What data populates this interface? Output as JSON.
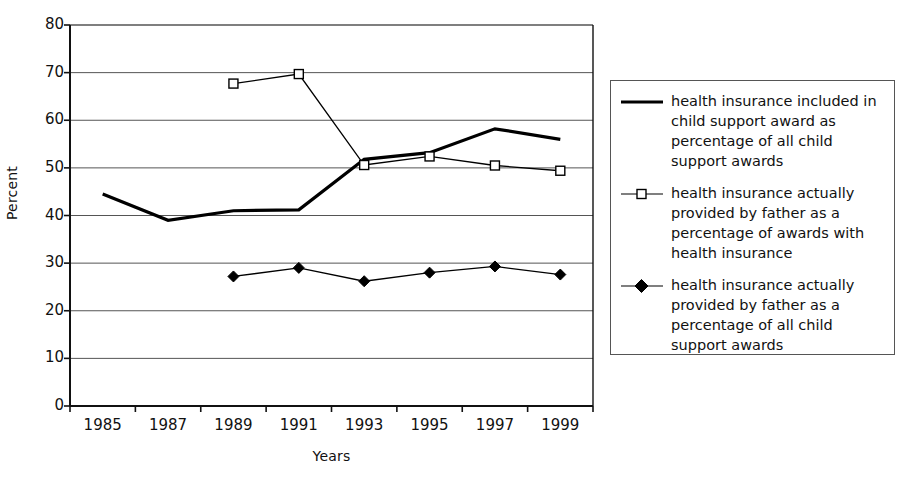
{
  "chart_data": {
    "type": "line",
    "title": "",
    "xlabel": "Years",
    "ylabel": "Percent",
    "categories": [
      "1985",
      "1987",
      "1989",
      "1991",
      "1993",
      "1995",
      "1997",
      "1999"
    ],
    "ylim": [
      0,
      80
    ],
    "ytick_step": 10,
    "yticks": [
      "80",
      "70",
      "60",
      "50",
      "40",
      "30",
      "20",
      "10",
      "0"
    ],
    "grid": "horizontal",
    "legend_position": "right",
    "series": [
      {
        "name": "health insurance included in child support award as percentage of all child support awards",
        "marker": "none",
        "line": "thick",
        "color": "#000000",
        "values": [
          44.5,
          39.0,
          41.0,
          41.2,
          51.8,
          53.2,
          58.2,
          56.0
        ]
      },
      {
        "name": "health insurance actually provided by father as a percentage of awards with health insurance",
        "marker": "open-square",
        "line": "thin",
        "color": "#000000",
        "values": [
          null,
          null,
          67.7,
          69.7,
          50.6,
          52.4,
          50.5,
          49.4
        ]
      },
      {
        "name": "health insurance actually provided by father as a percentage of all child support awards",
        "marker": "filled-diamond",
        "line": "thin",
        "color": "#000000",
        "values": [
          null,
          null,
          27.2,
          29.0,
          26.2,
          28.0,
          29.3,
          27.6
        ]
      }
    ]
  },
  "legend": {
    "entries": [
      {
        "label": "health insurance included in child support award as percentage of all child support awards",
        "marker": "none"
      },
      {
        "label": "health insurance actually provided by father as a percentage of awards with health insurance",
        "marker": "open-square"
      },
      {
        "label": "health insurance actually provided by father as a percentage of all child support awards",
        "marker": "filled-diamond"
      }
    ]
  },
  "axes": {
    "y_title": "Percent",
    "x_title": "Years"
  }
}
